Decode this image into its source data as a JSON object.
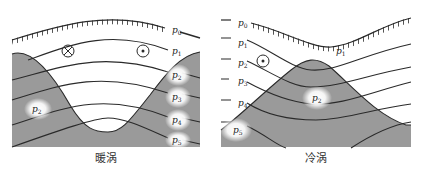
{
  "colors": {
    "background": "#ffffff",
    "water_mass": "#9a9a9a",
    "line": "#2a2a2a",
    "glow": "#ffffff"
  },
  "panels": [
    {
      "id": "warm",
      "caption": "暖涡",
      "isobar_labels": [
        "p0",
        "p1",
        "p2",
        "p3",
        "p4",
        "p5"
      ],
      "interior_labels": [
        "p2"
      ],
      "current_symbols": [
        "into-page",
        "out-of-page"
      ]
    },
    {
      "id": "cold",
      "caption": "冷涡",
      "isobar_labels": [
        "p0",
        "p1",
        "p2",
        "p3",
        "p4",
        "p5"
      ],
      "interior_labels": [
        "p1",
        "p2"
      ],
      "current_symbols": [
        "out-of-page"
      ]
    }
  ],
  "labels": {
    "p": "p",
    "s0": "0",
    "s1": "1",
    "s2": "2",
    "s3": "3",
    "s4": "4",
    "s5": "5"
  }
}
